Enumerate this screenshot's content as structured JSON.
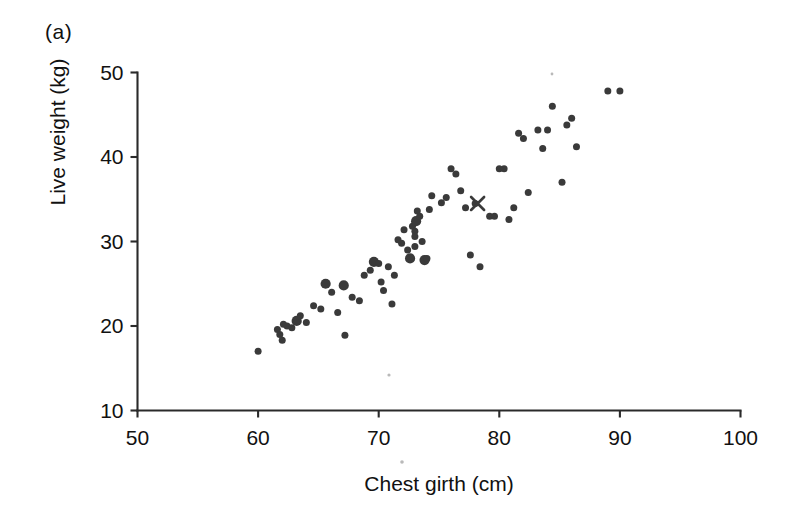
{
  "figure": {
    "panel_label": "(a)",
    "background_color": "#ffffff",
    "marker_color": "#3a3a3a"
  },
  "chart_data": {
    "type": "scatter",
    "title": "",
    "panel": "(a)",
    "xlabel": "Chest girth (cm)",
    "ylabel": "Live weight (kg)",
    "xlim": [
      50,
      100
    ],
    "ylim": [
      10,
      50
    ],
    "xticks": [
      50,
      60,
      70,
      80,
      90,
      100
    ],
    "yticks": [
      10,
      20,
      30,
      40,
      50
    ],
    "xtick_labels": [
      "50",
      "60",
      "70",
      "80",
      "90",
      "100"
    ],
    "ytick_labels": [
      "10",
      "20",
      "30",
      "40",
      "50"
    ],
    "grid": false,
    "legend": null,
    "series": [
      {
        "name": "Observations",
        "marker": "circle",
        "x": [
          60.0,
          61.6,
          61.8,
          62.0,
          62.1,
          62.4,
          62.8,
          63.2,
          63.5,
          64.0,
          64.6,
          65.2,
          65.6,
          66.1,
          66.6,
          67.1,
          67.2,
          67.8,
          68.4,
          68.8,
          69.3,
          69.6,
          70.0,
          70.2,
          70.4,
          70.8,
          71.1,
          71.3,
          71.6,
          71.9,
          72.1,
          72.4,
          72.6,
          72.8,
          73.0,
          73.0,
          73.0,
          73.1,
          73.2,
          73.4,
          73.6,
          73.8,
          74.0,
          74.2,
          74.4,
          75.2,
          75.6,
          76.0,
          76.4,
          76.8,
          77.2,
          77.6,
          78.0,
          78.4,
          79.2,
          79.6,
          80.0,
          80.4,
          80.8,
          81.2,
          81.6,
          82.0,
          82.4,
          83.2,
          83.6,
          84.0,
          84.4,
          85.2,
          85.6,
          86.0,
          86.4,
          89.0,
          90.0
        ],
        "y": [
          17.0,
          19.6,
          19.0,
          18.3,
          20.2,
          20.0,
          19.8,
          20.6,
          21.2,
          20.4,
          22.4,
          22.0,
          25.0,
          24.0,
          21.6,
          24.8,
          18.9,
          23.4,
          23.0,
          26.0,
          26.6,
          27.6,
          27.4,
          25.2,
          24.2,
          27.0,
          22.6,
          26.0,
          30.2,
          29.8,
          31.4,
          29.0,
          28.0,
          31.8,
          31.2,
          30.6,
          29.4,
          32.4,
          33.6,
          33.0,
          30.0,
          27.8,
          28.0,
          33.8,
          35.4,
          34.6,
          35.2,
          38.6,
          38.0,
          36.0,
          34.0,
          28.4,
          34.5,
          27.0,
          33.0,
          33.0,
          38.6,
          38.6,
          32.6,
          34.0,
          42.8,
          42.2,
          35.8,
          43.2,
          41.0,
          43.2,
          46.0,
          37.0,
          43.8,
          44.6,
          41.2,
          47.8,
          47.8
        ],
        "sizes": [
          "s",
          "s",
          "s",
          "s",
          "s",
          "s",
          "s",
          "L",
          "s",
          "s",
          "s",
          "s",
          "L",
          "s",
          "s",
          "L",
          "s",
          "s",
          "s",
          "s",
          "s",
          "L",
          "s",
          "s",
          "s",
          "s",
          "s",
          "s",
          "s",
          "s",
          "s",
          "s",
          "L",
          "s",
          "s",
          "s",
          "s",
          "L",
          "s",
          "s",
          "s",
          "L",
          "s",
          "s",
          "s",
          "s",
          "s",
          "s",
          "s",
          "s",
          "s",
          "s",
          "s",
          "s",
          "s",
          "s",
          "s",
          "s",
          "s",
          "s",
          "s",
          "s",
          "s",
          "s",
          "s",
          "s",
          "s",
          "s",
          "s",
          "s",
          "s",
          "s",
          "s"
        ]
      },
      {
        "name": "Highlighted sample",
        "marker": "x",
        "x": [
          78.2
        ],
        "y": [
          34.5
        ]
      }
    ]
  }
}
